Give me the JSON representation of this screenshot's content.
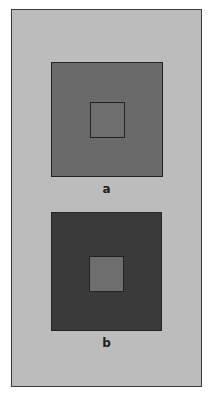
{
  "figure": {
    "type": "simultaneous-contrast-illusion",
    "canvas": {
      "width": 214,
      "height": 397,
      "margin_color": "#ffffff"
    },
    "panel": {
      "background_color": "#bcbcbc",
      "border_color": "#3b3b3b"
    },
    "panels": [
      {
        "id": "a",
        "caption": "a",
        "surround": {
          "fill_color": "#6a6a6a",
          "border_color": "#232323",
          "description": "medium gray surround"
        },
        "test_patch": {
          "fill_color": "#6e6e6e",
          "border_color": "#232323",
          "description": "medium gray test patch"
        }
      },
      {
        "id": "b",
        "caption": "b",
        "surround": {
          "fill_color": "#3a3a3a",
          "border_color": "#232323",
          "description": "dark gray surround"
        },
        "test_patch": {
          "fill_color": "#6e6e6e",
          "border_color": "#232323",
          "description": "medium gray test patch"
        }
      }
    ]
  }
}
